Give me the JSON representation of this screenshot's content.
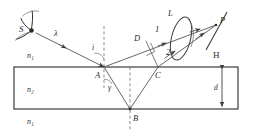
{
  "figure": {
    "type": "optics-ray-diagram",
    "canvas": {
      "width": 256,
      "height": 137
    },
    "background_color": "#ffffff",
    "ink_color": "#3d3d3d"
  },
  "labels": {
    "source": "S",
    "wavelength": "λ",
    "incidence_angle": "i",
    "refraction_angle": "γ",
    "point_a": "A",
    "point_b": "B",
    "point_c": "C",
    "point_d": "D",
    "point_p": "P",
    "lens": "L",
    "screen": "H",
    "ray_one": "1",
    "ray_two": "2",
    "index_above": "n₁",
    "index_film": "n₂",
    "index_below": "n₁",
    "thickness": "d"
  },
  "geometry": {
    "slab": {
      "x": 14,
      "y": 67,
      "width": 224,
      "height": 42
    },
    "point_a": {
      "x": 104,
      "y": 67
    },
    "point_b": {
      "x": 130,
      "y": 109
    },
    "point_c": {
      "x": 158,
      "y": 67
    },
    "point_d": {
      "x": 146,
      "y": 41
    },
    "point_p": {
      "x": 216,
      "y": 25
    },
    "source": {
      "x": 31,
      "y": 30
    },
    "lens_center": {
      "x": 182,
      "y": 38
    },
    "screen_top": {
      "x": 226,
      "y": 14
    },
    "screen_bottom": {
      "x": 208,
      "y": 48
    }
  },
  "annotations": {
    "normal_at_a": "dashed vertical normal through A",
    "normal_at_b": "dashed vertical normal through B",
    "perpendicular_marker": "right angle at D between ray 1 and segment CD",
    "thickness_marker": "double-headed vertical arrow labelled d at right of slab"
  }
}
